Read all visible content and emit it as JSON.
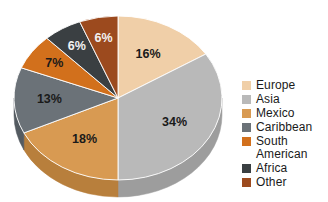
{
  "chart_data": {
    "type": "pie",
    "title": "",
    "subtitle": "",
    "xlabel": "",
    "ylabel": "",
    "legend_position": "right",
    "grid": false,
    "three_d": true,
    "start_angle_deg": 0,
    "direction": "clockwise",
    "categories": [
      "Europe",
      "Asia",
      "Mexico",
      "Caribbean",
      "South American",
      "Africa",
      "Other"
    ],
    "values": [
      16,
      34,
      18,
      13,
      7,
      6,
      6
    ],
    "value_unit": "%",
    "data_labels": [
      "16%",
      "34%",
      "18%",
      "13%",
      "7%",
      "6%",
      "6%"
    ],
    "colors": [
      "#f0cfa8",
      "#b9b9b9",
      "#d89a52",
      "#6b7278",
      "#d2701c",
      "#3a3f42",
      "#9c4a1e"
    ],
    "side_colors": [
      "#d8b188",
      "#9d9d9d",
      "#b87f3c",
      "#545b61",
      "#b25c12",
      "#2b2f32",
      "#7e3a16"
    ],
    "slices": [
      {
        "label": "Europe",
        "value": 16,
        "display": "16%",
        "color": "#f0cfa8",
        "side_color": "#d8b188",
        "label_dark_bg": false
      },
      {
        "label": "Asia",
        "value": 34,
        "display": "34%",
        "color": "#b9b9b9",
        "side_color": "#9d9d9d",
        "label_dark_bg": false
      },
      {
        "label": "Mexico",
        "value": 18,
        "display": "18%",
        "color": "#d89a52",
        "side_color": "#b87f3c",
        "label_dark_bg": false
      },
      {
        "label": "Caribbean",
        "value": 13,
        "display": "13%",
        "color": "#6b7278",
        "side_color": "#545b61",
        "label_dark_bg": false
      },
      {
        "label": "South American",
        "value": 7,
        "display": "7%",
        "color": "#d2701c",
        "side_color": "#b25c12",
        "label_dark_bg": false
      },
      {
        "label": "Africa",
        "value": 6,
        "display": "6%",
        "color": "#3a3f42",
        "side_color": "#2b2f32",
        "label_dark_bg": true
      },
      {
        "label": "Other",
        "value": 6,
        "display": "6%",
        "color": "#9c4a1e",
        "side_color": "#7e3a16",
        "label_dark_bg": true
      }
    ]
  },
  "legend": {
    "items": [
      {
        "label": "Europe",
        "color": "#f0cfa8"
      },
      {
        "label": "Asia",
        "color": "#b9b9b9"
      },
      {
        "label": "Mexico",
        "color": "#d89a52"
      },
      {
        "label": "Caribbean",
        "color": "#6b7278"
      },
      {
        "label": "South\nAmerican",
        "color": "#d2701c"
      },
      {
        "label": "Africa",
        "color": "#3a3f42"
      },
      {
        "label": "Other",
        "color": "#9c4a1e"
      }
    ]
  },
  "labels": {
    "europe_pct": "16%",
    "asia_pct": "34%",
    "mexico_pct": "18%",
    "caribbean_pct": "13%",
    "south_american_pct": "7%",
    "africa_pct": "6%",
    "other_pct": "6%"
  },
  "colors": {
    "background": "#ffffff",
    "text": "#1a1a1a",
    "text_on_dark": "#f2f2f2"
  }
}
